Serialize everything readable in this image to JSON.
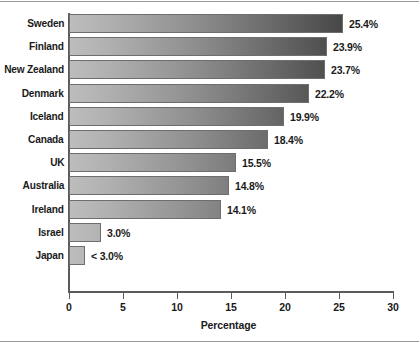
{
  "chart_data": {
    "type": "bar",
    "orientation": "horizontal",
    "title": "",
    "xlabel": "Percentage",
    "ylabel": "",
    "xlim": [
      0,
      30
    ],
    "xticks": [
      0,
      5,
      10,
      15,
      20,
      25,
      30
    ],
    "grid": false,
    "legend": null,
    "categories": [
      "Sweden",
      "Finland",
      "New Zealand",
      "Denmark",
      "Iceland",
      "Canada",
      "UK",
      "Australia",
      "Ireland",
      "Israel",
      "Japan"
    ],
    "values": [
      25.4,
      23.9,
      23.7,
      22.2,
      19.9,
      18.4,
      15.5,
      14.8,
      14.1,
      3.0,
      1.5
    ],
    "value_labels": [
      "25.4%",
      "23.9%",
      "23.7%",
      "22.2%",
      "19.9%",
      "18.4%",
      "15.5%",
      "14.8%",
      "14.1%",
      "3.0%",
      "< 3.0%"
    ],
    "bar_color_light": "#bdbdbd",
    "bar_color_dark": "#333333",
    "bar_border_color": "#6e6e6e",
    "axis_color": "#5b5b5b",
    "text_color": "#1a1a1a",
    "background_color": "#ffffff"
  }
}
